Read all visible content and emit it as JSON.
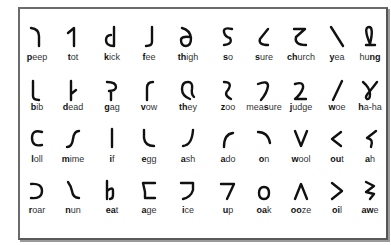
{
  "chart": {
    "title": "",
    "rows": [
      [
        {
          "pre": "",
          "bold": "p",
          "post": "eep",
          "glyph": "deep-hook-icon"
        },
        {
          "pre": "",
          "bold": "t",
          "post": "ot",
          "glyph": "tall-one-icon"
        },
        {
          "pre": "",
          "bold": "k",
          "post": "ick",
          "glyph": "curl-d-icon"
        },
        {
          "pre": "",
          "bold": "f",
          "post": "ee",
          "glyph": "j-hook-icon"
        },
        {
          "pre": "",
          "bold": "th",
          "post": "igh",
          "glyph": "delta-icon"
        },
        {
          "pre": "",
          "bold": "s",
          "post": "o",
          "glyph": "s-curve-icon"
        },
        {
          "pre": "",
          "bold": "s",
          "post": "ure",
          "glyph": "open-l-icon"
        },
        {
          "pre": "",
          "bold": "ch",
          "post": "urch",
          "glyph": "zeta-icon"
        },
        {
          "pre": "",
          "bold": "y",
          "post": "ea",
          "glyph": "backslash-icon"
        },
        {
          "pre": "hu",
          "bold": "ng",
          "post": "",
          "glyph": "loop-l-icon"
        }
      ],
      [
        {
          "pre": "",
          "bold": "b",
          "post": "ib",
          "glyph": "l-curve-icon"
        },
        {
          "pre": "",
          "bold": "d",
          "post": "ead",
          "glyph": "stem-flag-icon"
        },
        {
          "pre": "",
          "bold": "g",
          "post": "ag",
          "glyph": "p-hook-icon"
        },
        {
          "pre": "",
          "bold": "v",
          "post": "ow",
          "glyph": "r-hook-icon"
        },
        {
          "pre": "",
          "bold": "th",
          "post": "ey",
          "glyph": "q-loop-icon"
        },
        {
          "pre": "",
          "bold": "z",
          "post": "oo",
          "glyph": "reverse-s-icon"
        },
        {
          "pre": "mea",
          "bold": "s",
          "post": "ure",
          "glyph": "seven-curve-icon"
        },
        {
          "pre": "",
          "bold": "j",
          "post": "udge",
          "glyph": "two-icon"
        },
        {
          "pre": "",
          "bold": "w",
          "post": "oe",
          "glyph": "slash-icon"
        },
        {
          "pre": "",
          "bold": "h",
          "post": "a-ha",
          "glyph": "gamma-loop-icon"
        }
      ],
      [
        {
          "pre": "",
          "bold": "l",
          "post": "oll",
          "glyph": "c-icon"
        },
        {
          "pre": "",
          "bold": "m",
          "post": "ime",
          "glyph": "s-stroke-icon"
        },
        {
          "pre": "",
          "bold": "i",
          "post": "f",
          "glyph": "bar-icon"
        },
        {
          "pre": "",
          "bold": "e",
          "post": "gg",
          "glyph": "l-cup-icon"
        },
        {
          "pre": "",
          "bold": "a",
          "post": "sh",
          "glyph": "j-cup-icon"
        },
        {
          "pre": "",
          "bold": "a",
          "post": "do",
          "glyph": "arc-up-icon"
        },
        {
          "pre": "",
          "bold": "o",
          "post": "n",
          "glyph": "arc-right-icon"
        },
        {
          "pre": "",
          "bold": "w",
          "post": "ool",
          "glyph": "v-icon"
        },
        {
          "pre": "",
          "bold": "ou",
          "post": "t",
          "glyph": "less-than-icon"
        },
        {
          "pre": "",
          "bold": "a",
          "post": "h",
          "glyph": "hook-s-icon"
        }
      ],
      [
        {
          "pre": "",
          "bold": "r",
          "post": "oar",
          "glyph": "reverse-c-icon"
        },
        {
          "pre": "",
          "bold": "n",
          "post": "un",
          "glyph": "wave-icon"
        },
        {
          "pre": "",
          "bold": "ea",
          "post": "t",
          "glyph": "h-hook-icon"
        },
        {
          "pre": "",
          "bold": "a",
          "post": "ge",
          "glyph": "c-flag-icon"
        },
        {
          "pre": "",
          "bold": "i",
          "post": "ce",
          "glyph": "reverse-flag-icon"
        },
        {
          "pre": "",
          "bold": "u",
          "post": "p",
          "glyph": "seven-icon"
        },
        {
          "pre": "",
          "bold": "oa",
          "post": "k",
          "glyph": "o-icon"
        },
        {
          "pre": "",
          "bold": "oo",
          "post": "ze",
          "glyph": "caret-icon"
        },
        {
          "pre": "",
          "bold": "oi",
          "post": "l",
          "glyph": "greater-than-icon"
        },
        {
          "pre": "",
          "bold": "aw",
          "post": "e",
          "glyph": "zigzag-icon"
        }
      ]
    ]
  },
  "colors": {
    "ink": "#111111",
    "label": "#333333",
    "border": "#6b6b6b",
    "background": "#ffffff"
  }
}
